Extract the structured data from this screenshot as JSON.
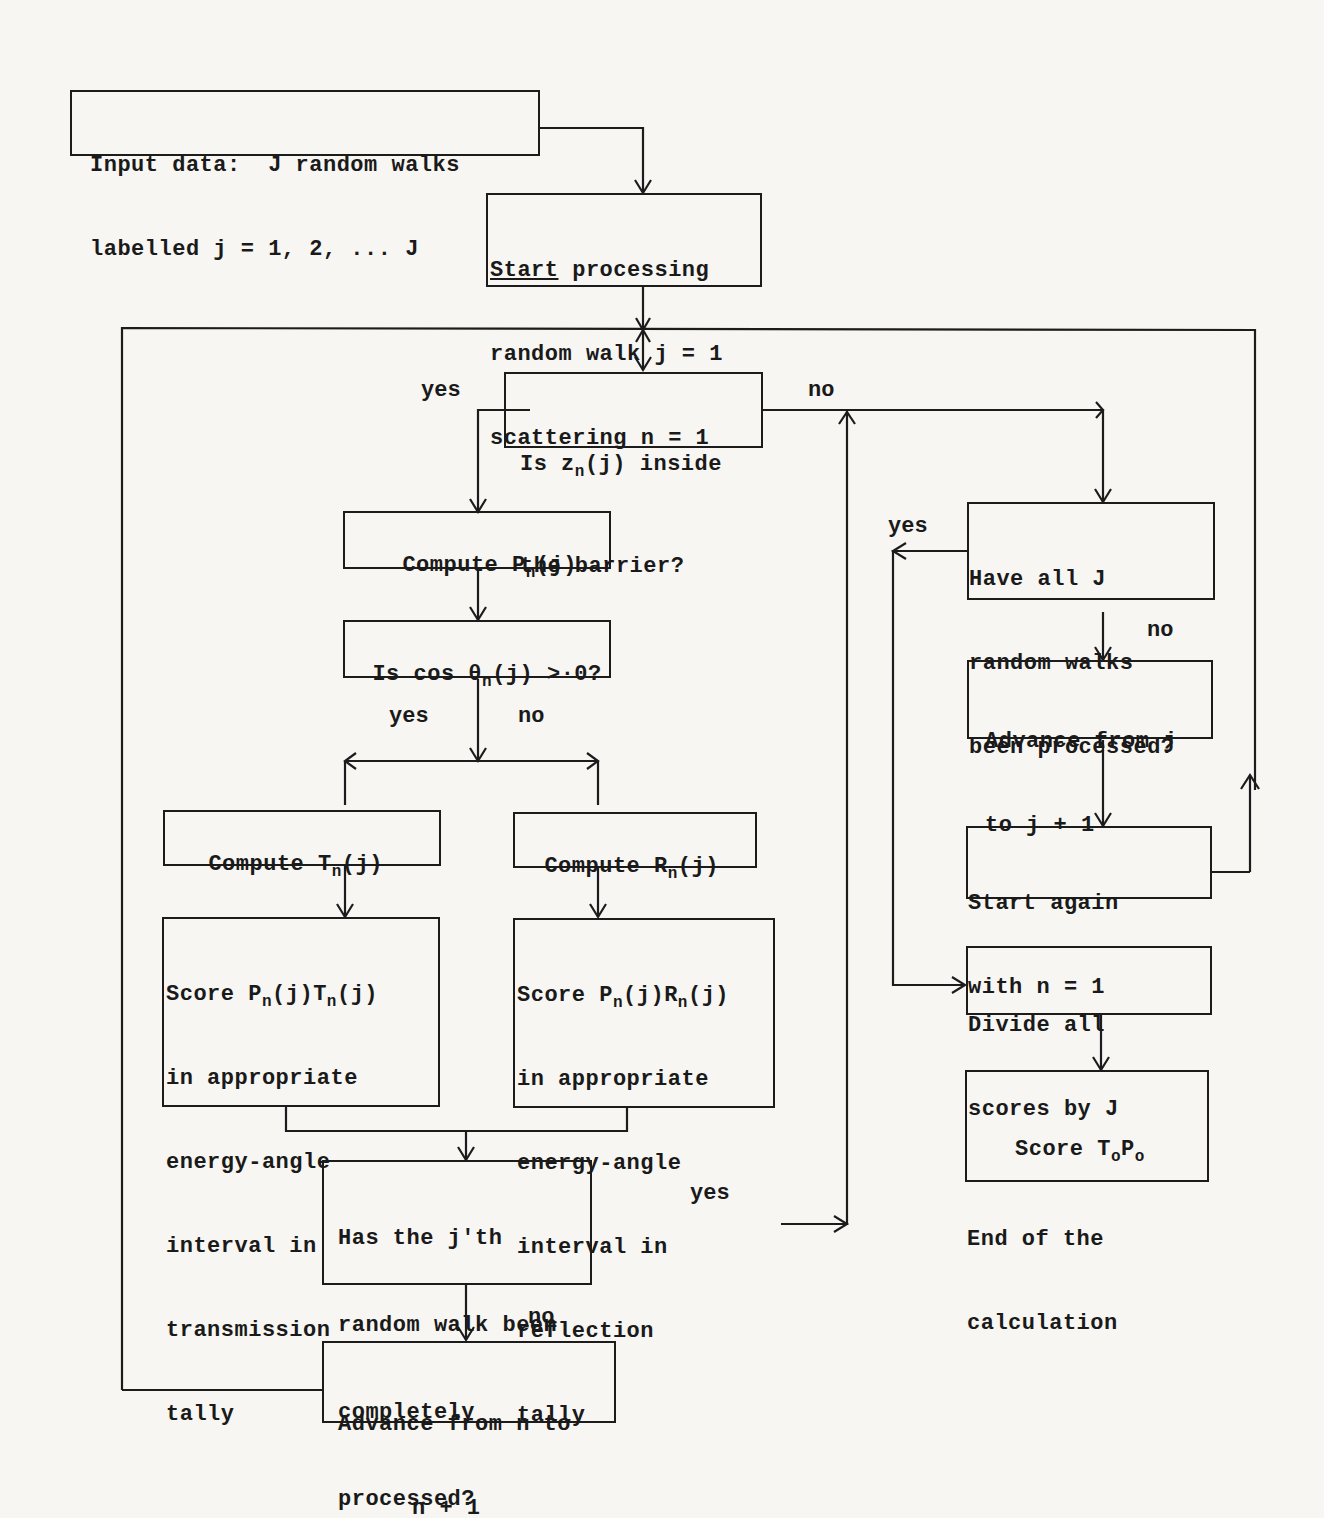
{
  "diagram": {
    "nodes": {
      "input": {
        "line1": "Input data:  J random walks",
        "line2": "labelled j = 1, 2, ... J"
      },
      "start": {
        "line1_u": "Start",
        "line1_rest": " processing",
        "line2": "random walk j = 1",
        "line3": "scattering n = 1"
      },
      "inside": {
        "a": "Is z",
        "sub": "n",
        "b": "(j) inside",
        "line2": "the barrier?"
      },
      "computeP": {
        "a": "Compute P",
        "sub": "n",
        "b": "(j)"
      },
      "cos": {
        "a": "Is cos θ",
        "sub": "n",
        "b": "(j) >·0?"
      },
      "computeT": {
        "a": "Compute T",
        "sub": "n",
        "b": "(j)"
      },
      "computeR": {
        "a": "Compute R",
        "sub": "n",
        "b": "(j)"
      },
      "scoreT": {
        "a": "Score P",
        "sub1": "n",
        "b": "(j)T",
        "sub2": "n",
        "c": "(j)",
        "l2": "in appropriate",
        "l3": "energy-angle",
        "l4": "interval in",
        "l5": "transmission",
        "l6": "tally"
      },
      "scoreR": {
        "a": "Score P",
        "sub1": "n",
        "b": "(j)R",
        "sub2": "n",
        "c": "(j)",
        "l2": "in appropriate",
        "l3": "energy-angle",
        "l4": "interval in",
        "l5": "reflection",
        "l6": "tally"
      },
      "complete": {
        "l1": "Has the j'th",
        "l2": "random walk been",
        "l3": "completely",
        "l4": "processed?"
      },
      "advanceN": {
        "l1": "Advance from n to",
        "l2": "n + 1"
      },
      "allJ": {
        "l1": "Have all J",
        "l2": "random walks",
        "l3": "been processed?"
      },
      "advanceJ": {
        "l1": "Advance from j",
        "l2": "to j + 1"
      },
      "startAgain": {
        "l1": "Start again",
        "l2": "with n = 1"
      },
      "divide": {
        "l1": "Divide all",
        "l2": "scores by J"
      },
      "end": {
        "a": "Score T",
        "sub1": "o",
        "b": "P",
        "sub2": "o",
        "l2": "End of the",
        "l3": "calculation"
      }
    },
    "edge_labels": {
      "inside_yes": "yes",
      "inside_no": "no",
      "cos_yes": "yes",
      "cos_no": "no",
      "complete_yes": "yes",
      "complete_no": "no",
      "allJ_yes": "yes",
      "allJ_no": "no"
    }
  }
}
